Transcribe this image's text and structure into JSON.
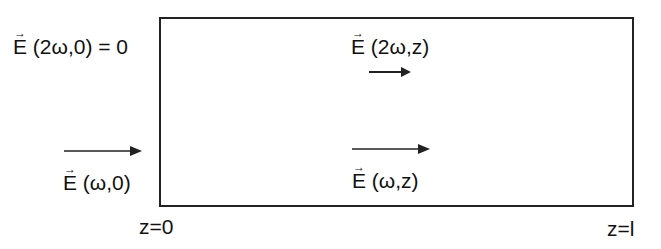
{
  "diagram": {
    "title": "",
    "boundaries": {
      "left": "z=0",
      "right": "z=l"
    },
    "fields": [
      {
        "id": "E_2w_0",
        "symbol": "E",
        "args": "(2ω,0)",
        "suffix": " = 0",
        "position": "top-left outside box"
      },
      {
        "id": "E_2w_z",
        "symbol": "E",
        "args": "(2ω,z)",
        "suffix": "",
        "position": "top center inside box"
      },
      {
        "id": "E_w_0",
        "symbol": "E",
        "args": "(ω,0)",
        "suffix": "",
        "position": "bottom-left outside box"
      },
      {
        "id": "E_w_z",
        "symbol": "E",
        "args": "(ω,z)",
        "suffix": "",
        "position": "bottom center inside box"
      }
    ],
    "arrows": [
      {
        "id": "arrow-2w-z",
        "direction": "right",
        "near": "E_2w_z"
      },
      {
        "id": "arrow-w-0",
        "direction": "right",
        "near": "E_w_0"
      },
      {
        "id": "arrow-w-z",
        "direction": "right",
        "near": "E_w_z"
      }
    ],
    "colors": {
      "line": "#222222",
      "text": "#111111",
      "background": "#ffffff"
    }
  }
}
